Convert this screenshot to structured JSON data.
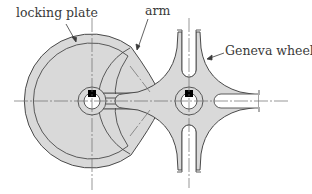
{
  "diagram": {
    "colors": {
      "fill": "#d9d9d9",
      "stroke": "#4a4a4a",
      "centerline": "#6a6a6a",
      "hole": "#ffffff",
      "key": "#000000",
      "label": "#3a3a3a"
    },
    "labels": {
      "locking_plate": "locking plate",
      "arm": "arm",
      "geneva_wheel": "Geneva wheel"
    },
    "components": [
      {
        "id": "locking-plate",
        "label": "locking plate",
        "center": [
          92,
          101
        ],
        "outer_radius": 67,
        "inner_radius": 58
      },
      {
        "id": "drive-hub",
        "center": [
          92,
          101
        ],
        "hub_radius": 14,
        "bore_radius": 8,
        "key": "square"
      },
      {
        "id": "arm",
        "label": "arm",
        "pin_center": [
          160,
          101
        ],
        "pin_radius_outer": 6,
        "pin_radius_inner": 3
      },
      {
        "id": "geneva-wheel",
        "label": "Geneva wheel",
        "center": [
          189,
          101
        ],
        "slots": 4,
        "hub_radius": 14,
        "bore_radius": 8,
        "key": "square"
      }
    ]
  }
}
